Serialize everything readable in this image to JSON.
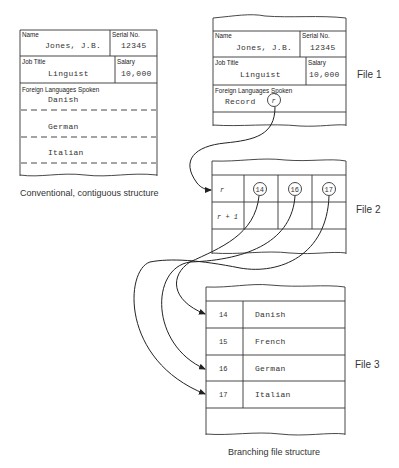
{
  "conventional": {
    "caption": "Conventional, contiguous structure",
    "name_label": "Name",
    "name_value": "Jones, J.B.",
    "serial_label": "Serial No.",
    "serial_value": "12345",
    "job_label": "Job Title",
    "job_value": "Linguist",
    "salary_label": "Salary",
    "salary_value": "10,000",
    "languages_label": "Foreign Languages Spoken",
    "languages": [
      "Danish",
      "German",
      "Italian"
    ]
  },
  "branching": {
    "caption": "Branching file structure",
    "file1": {
      "label": "File 1",
      "name_label": "Name",
      "name_value": "Jones, J.B.",
      "serial_label": "Serial No.",
      "serial_value": "12345",
      "job_label": "Job Title",
      "job_value": "Linguist",
      "salary_label": "Salary",
      "salary_value": "10,000",
      "languages_label": "Foreign Languages Spoken",
      "record_label": "Record",
      "record_pointer": "r"
    },
    "file2": {
      "label": "File 2",
      "rows": [
        {
          "key": "r",
          "pointers": [
            "14",
            "16",
            "17"
          ]
        },
        {
          "key": "r + 1",
          "pointers": [
            "",
            "",
            ""
          ]
        }
      ]
    },
    "file3": {
      "label": "File 3",
      "rows": [
        {
          "id": "14",
          "language": "Danish"
        },
        {
          "id": "15",
          "language": "French"
        },
        {
          "id": "16",
          "language": "German"
        },
        {
          "id": "17",
          "language": "Italian"
        }
      ]
    }
  }
}
